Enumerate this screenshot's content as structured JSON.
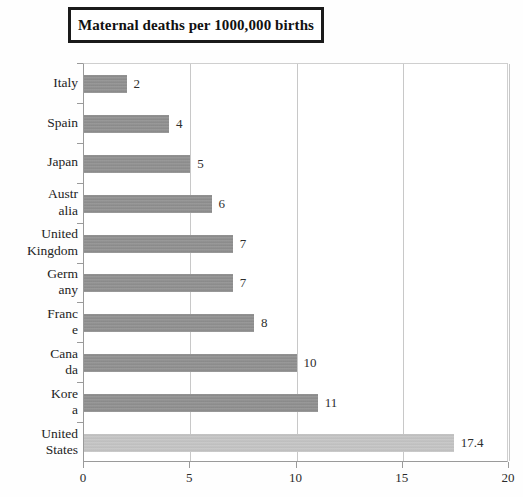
{
  "chart_data": {
    "type": "bar",
    "orientation": "horizontal",
    "title": "Maternal deaths per 1000,000 births",
    "xlabel": "",
    "ylabel": "",
    "xlim": [
      0,
      20
    ],
    "xticks": [
      "0",
      "5",
      "10",
      "15",
      "20"
    ],
    "grid": true,
    "legend": "none",
    "categories": [
      "Italy",
      "Spain",
      "Japan",
      "Australia",
      "United Kingdom",
      "Germany",
      "France",
      "Canada",
      "Korea",
      "United States"
    ],
    "category_label_lines": [
      [
        "Italy"
      ],
      [
        "Spain"
      ],
      [
        "Japan"
      ],
      [
        "Austr",
        "alia"
      ],
      [
        "United",
        "Kingdom"
      ],
      [
        "Germ",
        "any"
      ],
      [
        "Franc",
        "e"
      ],
      [
        "Cana",
        "da"
      ],
      [
        "Kore",
        "a"
      ],
      [
        "United",
        "States"
      ]
    ],
    "values": [
      2,
      4,
      5,
      6,
      7,
      7,
      8,
      10,
      11,
      17.4
    ],
    "value_labels": [
      "2",
      "4",
      "5",
      "6",
      "7",
      "7",
      "8",
      "10",
      "11",
      "17.4"
    ],
    "bar_colors": [
      "#8d8d8d",
      "#8d8d8d",
      "#8d8d8d",
      "#8d8d8d",
      "#8d8d8d",
      "#8d8d8d",
      "#8d8d8d",
      "#8d8d8d",
      "#8d8d8d",
      "#c2c2c2"
    ],
    "colors": {
      "bar_default": "#8d8d8d",
      "bar_highlight": "#c2c2c2",
      "gridline": "#c8c8c8",
      "axis": "#9a9a9a",
      "title_border": "#1a1a1a",
      "text": "#232323",
      "background": "#ffffff"
    }
  }
}
